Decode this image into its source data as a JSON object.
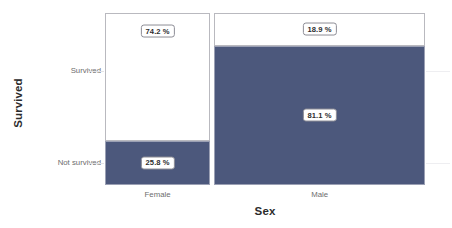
{
  "chart_data": {
    "type": "mosaic",
    "title": "",
    "xlabel": "Sex",
    "ylabel": "Survived",
    "x_categories": [
      "Female",
      "Male"
    ],
    "y_categories": [
      "Survived",
      "Not survived"
    ],
    "grid": false,
    "legend": "none",
    "colors": {
      "survived_fill": "#ffffff",
      "not_survived_fill": "#4c587c",
      "panel_border": "#b9b9bf",
      "chip_border": "#8d8d96",
      "tick_text": "#6d6d6d",
      "title_text": "#2b2b2b"
    },
    "column_widths_pct": [
      33.3,
      66.7
    ],
    "cells": [
      {
        "x": "Female",
        "y": "Survived",
        "value": 74.2,
        "label": "74.2 %",
        "fill": "#ffffff"
      },
      {
        "x": "Female",
        "y": "Not survived",
        "value": 25.8,
        "label": "25.8 %",
        "fill": "#4c587c"
      },
      {
        "x": "Male",
        "y": "Survived",
        "value": 18.9,
        "label": "18.9 %",
        "fill": "#ffffff"
      },
      {
        "x": "Male",
        "y": "Not survived",
        "value": 81.1,
        "label": "81.1 %",
        "fill": "#4c587c"
      }
    ]
  },
  "axes": {
    "x_title": "Sex",
    "y_title": "Survived",
    "x_ticks": [
      {
        "label": "Female"
      },
      {
        "label": "Male"
      }
    ],
    "y_ticks": [
      {
        "label": "Survived"
      },
      {
        "label": "Not survived"
      }
    ]
  },
  "labels": {
    "female_survived": "74.2 %",
    "female_not_survived": "25.8 %",
    "male_survived": "18.9 %",
    "male_not_survived": "81.1 %"
  }
}
